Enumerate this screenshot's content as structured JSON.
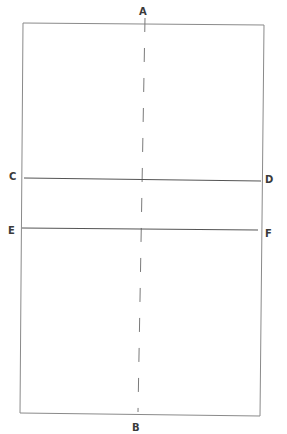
{
  "diagram": {
    "type": "rectangle-with-axes",
    "colors": {
      "background": "#ffffff",
      "frame": "#8a8a8a",
      "lines": "#555555",
      "centerline": "#7a7a7a",
      "labels": "#3a3a3a"
    },
    "labels": {
      "A": "A",
      "B": "B",
      "C": "C",
      "D": "D",
      "E": "E",
      "F": "F"
    },
    "rectangle": {
      "top_left": [
        23,
        23
      ],
      "top_right": [
        264,
        25
      ],
      "bottom_right": [
        260,
        416
      ],
      "bottom_left": [
        20,
        413
      ]
    },
    "centerline": {
      "from": "A",
      "to": "B",
      "style": "dashed",
      "start": [
        145,
        18
      ],
      "end": [
        138,
        412
      ]
    },
    "lines": [
      {
        "from": "C",
        "to": "D",
        "start": [
          24,
          178
        ],
        "end": [
          261,
          181
        ]
      },
      {
        "from": "E",
        "to": "F",
        "start": [
          22,
          228
        ],
        "end": [
          258,
          230
        ]
      }
    ]
  }
}
